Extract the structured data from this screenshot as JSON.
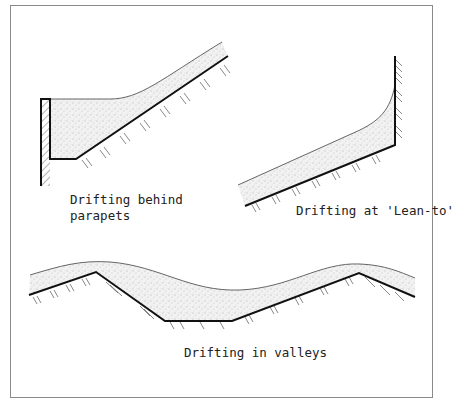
{
  "figure": {
    "panels": [
      {
        "id": "parapets",
        "label_lines": [
          "Drifting behind",
          "parapets"
        ]
      },
      {
        "id": "lean-to",
        "label_lines": [
          "Drifting at 'Lean-to'"
        ]
      },
      {
        "id": "valleys",
        "label_lines": [
          "Drifting in valleys"
        ]
      }
    ],
    "caption": ""
  },
  "colors": {
    "roof_line": "#111111",
    "snow_fill": "#e9e9e9",
    "snow_outline": "#555555",
    "frame_border": "#8a8a8a"
  }
}
